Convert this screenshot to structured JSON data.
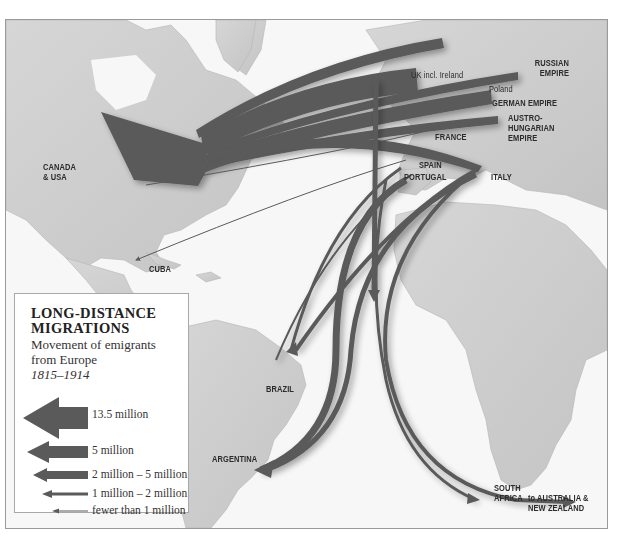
{
  "map": {
    "frame": {
      "border_color": "#9a9a9a",
      "sea_color": "#f7f7f7",
      "land_color": "#cfcfcf",
      "arrow_color": "#5a5a5a"
    },
    "origins": [
      {
        "id": "scandinavia",
        "label": "SCANDINAVIA"
      },
      {
        "id": "uk",
        "label": "UK incl. Ireland"
      },
      {
        "id": "russian-empire",
        "label": "RUSSIAN\nEMPIRE"
      },
      {
        "id": "poland",
        "label": "Poland"
      },
      {
        "id": "german-empire",
        "label": "GERMAN EMPIRE"
      },
      {
        "id": "austro-hungarian-empire",
        "label": "AUSTRO-\nHUNGARIAN\nEMPIRE"
      },
      {
        "id": "france",
        "label": "FRANCE"
      },
      {
        "id": "spain",
        "label": "SPAIN"
      },
      {
        "id": "portugal",
        "label": "PORTUGAL"
      },
      {
        "id": "italy",
        "label": "ITALY"
      }
    ],
    "destinations": [
      {
        "id": "canada-usa",
        "label": "CANADA\n& USA"
      },
      {
        "id": "cuba",
        "label": "CUBA"
      },
      {
        "id": "brazil",
        "label": "BRAZIL"
      },
      {
        "id": "argentina",
        "label": "ARGENTINA"
      },
      {
        "id": "south-africa",
        "label": "SOUTH\nAFRICA"
      },
      {
        "id": "australia-nz",
        "label": "to AUSTRALIA &\nNEW ZEALAND"
      }
    ]
  },
  "legend": {
    "title": "LONG-DISTANCE MIGRATIONS",
    "title_line1": "LONG-DISTANCE",
    "title_line2": "MIGRATIONS",
    "subtitle_line1": "Movement of emigrants",
    "subtitle_line2": "from Europe",
    "dates": "1815–1914",
    "items": [
      {
        "label": "13.5 million",
        "icon": "arrow-xl-icon"
      },
      {
        "label": "5 million",
        "icon": "arrow-lg-icon"
      },
      {
        "label": "2 million – 5 million",
        "icon": "arrow-md-icon"
      },
      {
        "label": "1 million – 2 million",
        "icon": "arrow-sm-icon"
      },
      {
        "label": "fewer than 1 million",
        "icon": "arrow-xs-icon"
      }
    ]
  }
}
